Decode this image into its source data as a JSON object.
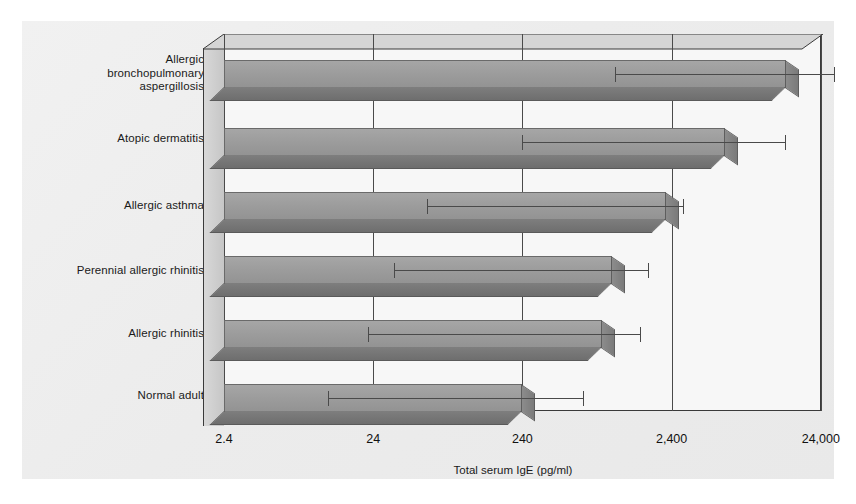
{
  "chart_data": {
    "type": "bar",
    "orientation": "horizontal",
    "title": "",
    "xlabel": "Total serum IgE (pg/ml)",
    "ylabel": "",
    "xscale": "log",
    "xlim": [
      2.4,
      24000
    ],
    "xticks": [
      2.4,
      24,
      240,
      2400,
      24000
    ],
    "xticklabels": [
      "2.4",
      "24",
      "240",
      "2,400",
      "24,000"
    ],
    "grid": true,
    "grid_axis": "x",
    "legend": false,
    "style": "3d-shaded-bars-with-error-bars",
    "categories": [
      "Allergic bronchopulmonary aspergillosis",
      "Atopic dermatitis",
      "Allergic asthma",
      "Perennial allergic rhinitis",
      "Allergic rhinitis",
      "Normal adult"
    ],
    "values": [
      14000,
      5500,
      2200,
      950,
      820,
      240
    ],
    "error_low": [
      1000,
      240,
      55,
      33,
      22,
      12
    ],
    "error_high": [
      30000,
      14000,
      2900,
      1700,
      1500,
      620
    ]
  },
  "categories": [
    {
      "lines": [
        "Allergic",
        "bronchopulmonary",
        "aspergillosis"
      ]
    },
    {
      "lines": [
        "Atopic dermatitis"
      ]
    },
    {
      "lines": [
        "Allergic asthma"
      ]
    },
    {
      "lines": [
        "Perennial allergic rhinitis"
      ]
    },
    {
      "lines": [
        "Allergic rhinitis"
      ]
    },
    {
      "lines": [
        "Normal adult"
      ]
    }
  ],
  "axis": {
    "title": "Total serum IgE (pg/ml)",
    "ticks": [
      "2.4",
      "24",
      "240",
      "2,400",
      "24,000"
    ]
  },
  "colors": {
    "background": "#ececec",
    "plot_background": "#f7f7f7",
    "bar_face": "#9b9b9b",
    "bar_side": "#7a7a7a",
    "bar_bottom": "#6e6e6e",
    "axis_line": "#3a3a3a",
    "grid": "#4a4a4a",
    "text": "#1a1a1a"
  }
}
